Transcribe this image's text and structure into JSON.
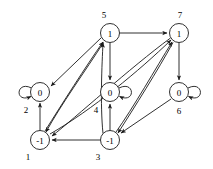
{
  "figure": {
    "kind": "directed-graph",
    "node_radius": 9.5,
    "nodes": [
      {
        "id": "1",
        "value": "-1",
        "cx": 40,
        "cy": 140,
        "label_x": 28,
        "label_y": 157,
        "loop": null
      },
      {
        "id": "2",
        "value": "0",
        "cx": 40,
        "cy": 92,
        "label_x": 26,
        "label_y": 110,
        "loop": "left"
      },
      {
        "id": "3",
        "value": "-1",
        "cx": 110,
        "cy": 140,
        "label_x": 98,
        "label_y": 157,
        "loop": null
      },
      {
        "id": "4",
        "value": "0",
        "cx": 110,
        "cy": 92,
        "label_x": 96,
        "label_y": 110,
        "loop": "right"
      },
      {
        "id": "5",
        "value": "1",
        "cx": 110,
        "cy": 33,
        "label_x": 104,
        "label_y": 15,
        "loop": null
      },
      {
        "id": "6",
        "value": "0",
        "cx": 179,
        "cy": 92,
        "label_x": 179,
        "label_y": 111,
        "loop": "right"
      },
      {
        "id": "7",
        "value": "1",
        "cx": 179,
        "cy": 33,
        "label_x": 180,
        "label_y": 15,
        "loop": null
      }
    ],
    "edges": [
      {
        "from": "2",
        "to": "2",
        "type": "self-loop"
      },
      {
        "from": "4",
        "to": "4",
        "type": "self-loop"
      },
      {
        "from": "6",
        "to": "6",
        "type": "self-loop"
      },
      {
        "from": "1",
        "to": "2",
        "type": "straight"
      },
      {
        "from": "5",
        "to": "2",
        "type": "straight"
      },
      {
        "from": "1",
        "to": "5",
        "type": "curved"
      },
      {
        "from": "5",
        "to": "1",
        "type": "curved"
      },
      {
        "from": "3",
        "to": "5",
        "type": "straight"
      },
      {
        "from": "5",
        "to": "7",
        "type": "straight"
      },
      {
        "from": "5",
        "to": "4",
        "type": "straight"
      },
      {
        "from": "3",
        "to": "4",
        "type": "straight"
      },
      {
        "from": "3",
        "to": "1",
        "type": "straight"
      },
      {
        "from": "3",
        "to": "7",
        "type": "curved"
      },
      {
        "from": "7",
        "to": "3",
        "type": "curved"
      },
      {
        "from": "7",
        "to": "6",
        "type": "straight"
      },
      {
        "from": "6",
        "to": "3",
        "type": "straight"
      },
      {
        "from": "7",
        "to": "1",
        "type": "straight"
      }
    ],
    "colors": {
      "stroke": "#1a1a1a",
      "node_fill": "#ffffff",
      "background": "#ffffff"
    }
  }
}
